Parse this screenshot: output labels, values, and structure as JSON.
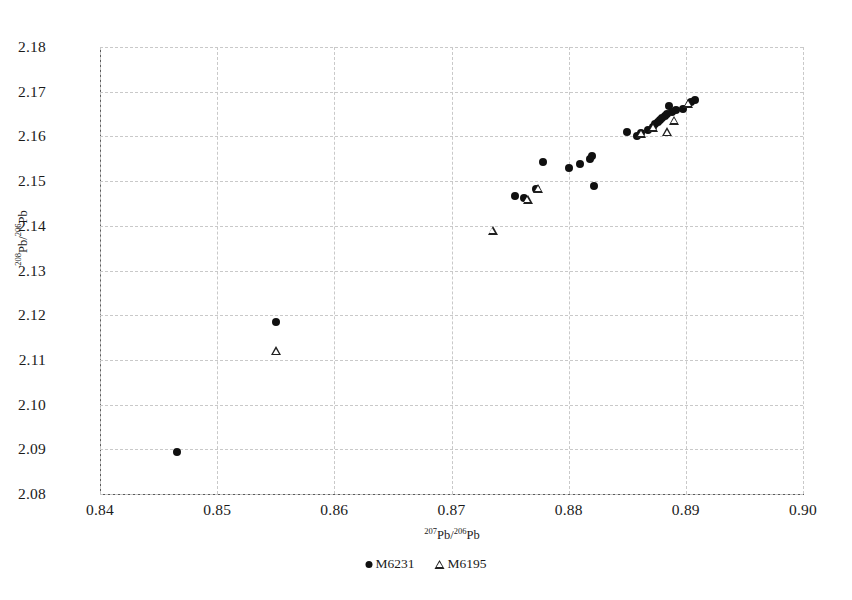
{
  "chart_data": {
    "type": "scatter",
    "title": "",
    "xlabel": "207Pb/206Pb",
    "ylabel": "208Pb/206Pb",
    "xlabel_parts": {
      "sup1": "207",
      "mid": "Pb/",
      "sup2": "206",
      "end": "Pb"
    },
    "ylabel_parts": {
      "sup1": "208",
      "mid": "Pb/",
      "sup2": "206",
      "end": "Pb"
    },
    "xlim": [
      0.84,
      0.9
    ],
    "ylim": [
      2.08,
      2.18
    ],
    "xticks": [
      "0.84",
      "0.85",
      "0.86",
      "0.87",
      "0.88",
      "0.89",
      "0.90"
    ],
    "xtick_values": [
      0.84,
      0.85,
      0.86,
      0.87,
      0.88,
      0.89,
      0.9
    ],
    "yticks": [
      "2.18",
      "2.17",
      "2.16",
      "2.15",
      "2.14",
      "2.13",
      "2.12",
      "2.11",
      "2.10",
      "2.09",
      "2.08"
    ],
    "ytick_values": [
      2.18,
      2.17,
      2.16,
      2.15,
      2.14,
      2.13,
      2.12,
      2.11,
      2.1,
      2.09,
      2.08
    ],
    "grid": true,
    "grid_style": "dashed",
    "legend_position": "bottom-center",
    "series": [
      {
        "name": "M6231",
        "marker": "filled-circle",
        "color": "#101010",
        "points": [
          [
            0.8466,
            2.0893
          ],
          [
            0.855,
            2.1185
          ],
          [
            0.8754,
            2.1467
          ],
          [
            0.8762,
            2.1463
          ],
          [
            0.8772,
            2.1482
          ],
          [
            0.8778,
            2.1543
          ],
          [
            0.88,
            2.153
          ],
          [
            0.881,
            2.1538
          ],
          [
            0.8818,
            2.1549
          ],
          [
            0.882,
            2.1557
          ],
          [
            0.8822,
            2.149
          ],
          [
            0.885,
            2.161
          ],
          [
            0.8858,
            2.1602
          ],
          [
            0.8862,
            2.1607
          ],
          [
            0.8868,
            2.1614
          ],
          [
            0.8872,
            2.1622
          ],
          [
            0.8874,
            2.1628
          ],
          [
            0.8876,
            2.1633
          ],
          [
            0.8878,
            2.1637
          ],
          [
            0.888,
            2.1641
          ],
          [
            0.8882,
            2.1645
          ],
          [
            0.8884,
            2.165
          ],
          [
            0.8886,
            2.1668
          ],
          [
            0.8888,
            2.1655
          ],
          [
            0.8892,
            2.1658
          ],
          [
            0.8898,
            2.1662
          ],
          [
            0.8904,
            2.1678
          ],
          [
            0.8908,
            2.1681
          ]
        ]
      },
      {
        "name": "M6195",
        "marker": "open-triangle",
        "color": "#202020",
        "points": [
          [
            0.855,
            2.112
          ],
          [
            0.8735,
            2.139
          ],
          [
            0.8765,
            2.1458
          ],
          [
            0.8774,
            2.1484
          ],
          [
            0.8862,
            2.1607
          ],
          [
            0.8872,
            2.162
          ],
          [
            0.8884,
            2.161
          ],
          [
            0.889,
            2.1636
          ],
          [
            0.8902,
            2.1673
          ]
        ]
      }
    ],
    "legend": [
      {
        "label": "M6231",
        "marker": "filled-circle"
      },
      {
        "label": "M6195",
        "marker": "open-triangle"
      }
    ]
  },
  "colors": {
    "marker": "#101010",
    "grid": "#c9c9c9",
    "axis": "#5a5a5a",
    "background": "#ffffff"
  }
}
